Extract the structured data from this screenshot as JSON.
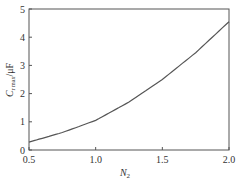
{
  "chart_data": {
    "type": "line",
    "title": "",
    "xlabel": "N2",
    "ylabel": "C r max/μF",
    "xlim": [
      0.5,
      2.0
    ],
    "ylim": [
      0,
      5
    ],
    "xticks": [
      "0.5",
      "1.0",
      "1.5",
      "2.0"
    ],
    "yticks": [
      "0",
      "1",
      "2",
      "3",
      "4",
      "5"
    ],
    "grid": false,
    "series": [
      {
        "name": "C_r,max",
        "x": [
          0.5,
          0.75,
          1.0,
          1.25,
          1.5,
          1.75,
          2.0
        ],
        "values": [
          0.28,
          0.62,
          1.05,
          1.7,
          2.5,
          3.45,
          4.55
        ]
      }
    ]
  },
  "axes": {
    "x_label_main": "N",
    "x_label_sub": "2",
    "y_label_main": "C",
    "y_label_sub": "r max",
    "y_label_unit": "/μF"
  }
}
